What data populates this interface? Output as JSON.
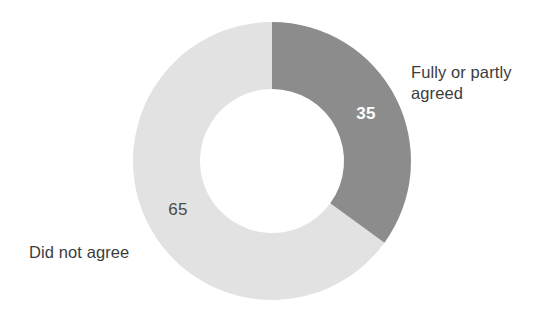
{
  "chart_data": {
    "type": "pie",
    "variant": "donut",
    "title": "",
    "subtitle": "",
    "xlabel": "",
    "ylabel": "",
    "legend_position": "outside-callout",
    "grid": false,
    "total": 100,
    "units": "percent",
    "categories": [
      "Fully or partly agreed",
      "Did not agree"
    ],
    "values": [
      35,
      65
    ],
    "slices": [
      {
        "label": "Fully or partly agreed",
        "value": 35,
        "value_text": "35",
        "color": "#8c8c8c",
        "value_text_color": "#ffffff",
        "start_angle_deg": 0,
        "end_angle_deg": 126
      },
      {
        "label": "Did not agree",
        "value": 65,
        "value_text": "65",
        "color": "#e2e2e2",
        "value_text_color": "#4a4a4a",
        "start_angle_deg": 126,
        "end_angle_deg": 360
      }
    ]
  },
  "chart": {
    "background_color": "#ffffff",
    "geometry": {
      "center_x": 272,
      "center_y": 161,
      "outer_radius": 139,
      "inner_radius": 72,
      "start_angle_deg": 0
    },
    "slice_agreed": {
      "label": "Fully or partly agreed",
      "value_text": "35",
      "color": "#8c8c8c"
    },
    "slice_disagreed": {
      "label": "Did not agree",
      "value_text": "65",
      "color": "#e2e2e2"
    }
  }
}
